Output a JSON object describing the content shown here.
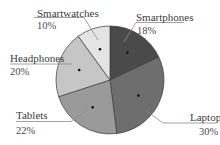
{
  "chart_data": {
    "type": "pie",
    "title": "",
    "start_angle_deg": 0,
    "direction": "clockwise",
    "categories": [
      "Smartphones",
      "Laptop",
      "Tablets",
      "Headphones",
      "Smartwatches"
    ],
    "values": [
      18,
      30,
      22,
      20,
      10
    ],
    "value_labels": [
      "18%",
      "30%",
      "22%",
      "20%",
      "10%"
    ],
    "colors": [
      "#4a4a4a",
      "#6e6e6e",
      "#9a9a9a",
      "#c6c6c6",
      "#e4e4e4"
    ],
    "legend": "none (callout labels with leader lines)"
  },
  "labels": {
    "smartphones": {
      "name": "Smartphones",
      "pct": "18%"
    },
    "laptop": {
      "name": "Laptop",
      "pct": "30%"
    },
    "tablets": {
      "name": "Tablets",
      "pct": "22%"
    },
    "headphones": {
      "name": "Headphones",
      "pct": "20%"
    },
    "smartwatches": {
      "name": "Smartwatches",
      "pct": "10%"
    }
  }
}
